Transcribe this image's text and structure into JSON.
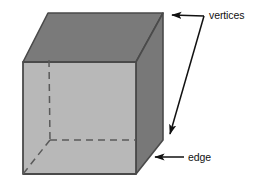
{
  "figure": {
    "background_color": "#ffffff",
    "shape": {
      "name": "cube",
      "faces": {
        "front": {
          "name": "front-face",
          "color": "#b8b8b8"
        },
        "top": {
          "name": "top-face",
          "color": "#7a7a7a"
        },
        "right": {
          "name": "right-face",
          "color": "#787878"
        }
      },
      "outline_color": "#4a4a4a",
      "hidden_edge_color": "#5a5a5a",
      "hidden_edge_style": "dashed",
      "vertices": {
        "front_top_left": [
          23,
          62
        ],
        "front_top_right": [
          136,
          62
        ],
        "front_bottom_left": [
          23,
          174
        ],
        "front_bottom_right": [
          136,
          174
        ],
        "back_top_left": [
          48,
          13
        ],
        "back_top_right": [
          163,
          13
        ],
        "back_bottom_right": [
          163,
          140
        ],
        "back_bottom_left_hidden": [
          50,
          140
        ]
      }
    },
    "annotations": [
      {
        "id": "vertices",
        "label": "vertices",
        "label_x": 209,
        "label_y": 19,
        "arrow_color": "#111111",
        "arrows": [
          {
            "name": "vertices-arrow-top",
            "from": [
              204,
              16
            ],
            "to": [
              167,
              15
            ]
          },
          {
            "name": "vertices-arrow-bottom",
            "from": [
              204,
              16
            ],
            "to": [
              167,
              138
            ]
          }
        ]
      },
      {
        "id": "edge",
        "label": "edge",
        "label_x": 188,
        "label_y": 161,
        "arrow_color": "#111111",
        "arrows": [
          {
            "name": "edge-arrow",
            "from": [
              184,
              157
            ],
            "to": [
              150,
              157
            ]
          }
        ]
      }
    ]
  }
}
